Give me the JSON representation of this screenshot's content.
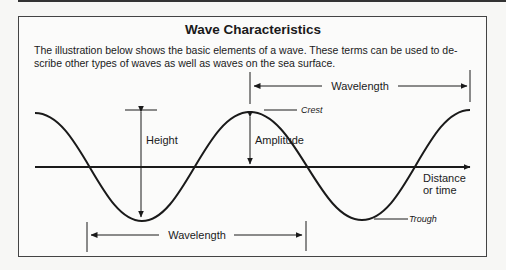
{
  "title": "Wave Characteristics",
  "intro": "The illustration below shows the basic elements of a wave. These terms can be used to de-scribe other types of waves as well as waves on the sea surface.",
  "intro_lines": [
    "The illustration below shows the basic elements of a wave. These terms can be used to de-",
    "scribe other types of waves as well as waves on the sea surface."
  ],
  "labels": {
    "height": "Height",
    "amplitude": "Amplitude",
    "crest": "Crest",
    "trough": "Trough",
    "wavelength_top": "Wavelength",
    "wavelength_bottom": "Wavelength",
    "axis_line1": "Distance",
    "axis_line2": "or time"
  },
  "colors": {
    "line": "#1a1a1a",
    "frame": "#444444",
    "background": "#fbfbfa"
  }
}
